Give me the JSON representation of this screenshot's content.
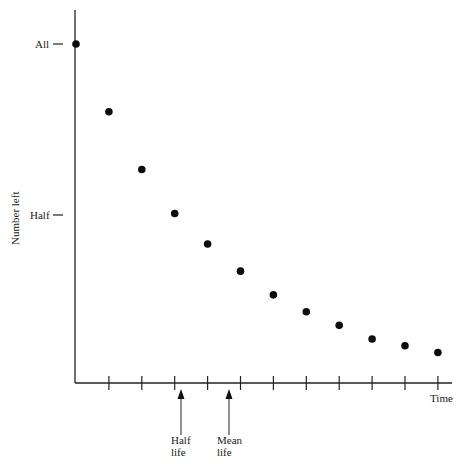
{
  "chart_data": {
    "type": "scatter",
    "title": "",
    "xlabel": "Time",
    "ylabel": "Number left",
    "y_tick_labels": [
      {
        "label": "All",
        "value": 1.0
      },
      {
        "label": "Half",
        "value": 0.5
      }
    ],
    "x": [
      0,
      1,
      2,
      3,
      4,
      5,
      6,
      7,
      8,
      9,
      10,
      11
    ],
    "values": [
      1.0,
      0.8,
      0.63,
      0.5,
      0.41,
      0.33,
      0.26,
      0.21,
      0.17,
      0.13,
      0.11,
      0.09
    ],
    "ylim": [
      0,
      1.0
    ],
    "xlim": [
      0,
      11.4
    ],
    "grid": false,
    "legend": null,
    "annotations": [
      {
        "text": "Half life",
        "lines": [
          "Half",
          "life"
        ],
        "x": 3
      },
      {
        "text": "Mean life",
        "lines": [
          "Mean",
          "life"
        ],
        "x": 4.5
      }
    ]
  },
  "labels": {
    "all": "All",
    "half": "Half",
    "ylabel": "Number left",
    "xlabel": "Time",
    "half_life_1": "Half",
    "half_life_2": "life",
    "mean_life_1": "Mean",
    "mean_life_2": "life"
  }
}
